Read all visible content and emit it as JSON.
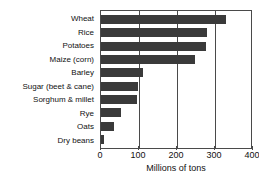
{
  "chart_data": {
    "type": "bar",
    "orientation": "horizontal",
    "title": "",
    "xlabel": "Millions of tons",
    "ylabel": "",
    "xlim": [
      0,
      400
    ],
    "xticks": [
      0,
      100,
      200,
      300,
      400
    ],
    "xtick_labels": [
      "0",
      "100",
      "200",
      "300",
      "400"
    ],
    "grid": true,
    "grid_axis": "x",
    "legend": false,
    "bar_color": "#3a3a3a",
    "categories": [
      "Wheat",
      "Rice",
      "Potatoes",
      "Maize (corn)",
      "Barley",
      "Sugar (beet & cane)",
      "Sorghum & millet",
      "Rye",
      "Oats",
      "Dry beans"
    ],
    "values": [
      330,
      280,
      275,
      248,
      110,
      97,
      94,
      53,
      35,
      8
    ]
  }
}
